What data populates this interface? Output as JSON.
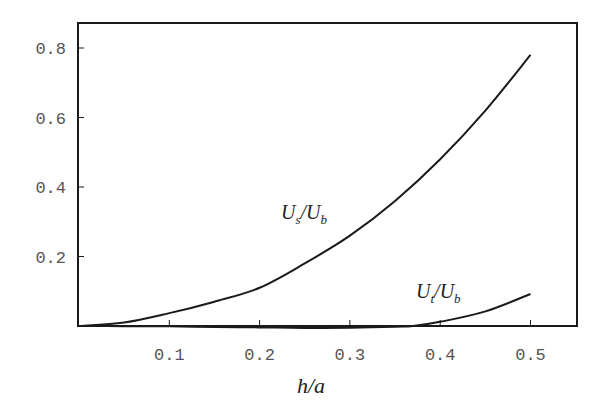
{
  "chart_data": {
    "type": "line",
    "title": "",
    "xlabel": "h/a",
    "ylabel": "",
    "xlim": [
      0,
      0.55
    ],
    "ylim": [
      0,
      0.87
    ],
    "grid": false,
    "legend": "inline curve labels",
    "x_ticks": [
      "0.1",
      "0.2",
      "0.3",
      "0.4",
      "0.5"
    ],
    "y_ticks": [
      "0.2",
      "0.4",
      "0.6",
      "0.8"
    ],
    "series": [
      {
        "name": "U_s/U_b",
        "label_main": "U",
        "label_sub1": "s",
        "label_slash": "/U",
        "label_sub2": "b",
        "x": [
          0,
          0.05,
          0.1,
          0.15,
          0.2,
          0.25,
          0.3,
          0.35,
          0.4,
          0.45,
          0.5
        ],
        "values": [
          0,
          0.01,
          0.037,
          0.07,
          0.11,
          0.18,
          0.26,
          0.36,
          0.48,
          0.62,
          0.78
        ]
      },
      {
        "name": "U_t/U_b",
        "label_main": "U",
        "label_sub1": "t",
        "label_slash": "/U",
        "label_sub2": "b",
        "x": [
          0,
          0.05,
          0.1,
          0.15,
          0.2,
          0.25,
          0.27,
          0.3,
          0.35,
          0.37,
          0.4,
          0.45,
          0.5
        ],
        "values": [
          0,
          -0.0005,
          -0.001,
          -0.003,
          -0.004,
          -0.0055,
          -0.006,
          -0.005,
          -0.002,
          0,
          0.012,
          0.042,
          0.092
        ]
      }
    ]
  },
  "colors": {
    "line": "#1a1a1a",
    "frame": "#1a1a1a",
    "tick_label": "#555555"
  }
}
